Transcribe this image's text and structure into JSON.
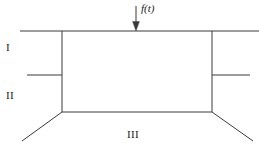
{
  "figure": {
    "type": "structural-frame-diagram",
    "background_color": "#ffffff",
    "line_color": "#3a3a3a",
    "text_color": "#1a1a1a",
    "width": 259,
    "height": 158,
    "labels": {
      "region_1": "I",
      "region_2": "II",
      "region_3": "III",
      "force": "f(t)"
    },
    "load": {
      "label": "f(t)",
      "direction": "down",
      "arrow_x": 136,
      "arrow_top_y": 6,
      "arrow_tip_y": 30
    },
    "geometry": {
      "top_beam": {
        "y": 31,
        "x_start": 20,
        "x_end": 259
      },
      "left_column": {
        "x": 62,
        "y_top": 31,
        "y_bottom": 112
      },
      "right_column": {
        "x": 212,
        "y_top": 31,
        "y_bottom": 112
      },
      "bottom_beam": {
        "y": 112,
        "x_start": 62,
        "x_end": 212
      },
      "mid_left_stub": {
        "y": 75,
        "x_start": 27,
        "x_end": 62
      },
      "mid_right_stub": {
        "y": 75,
        "x_start": 212,
        "x_end": 250
      },
      "left_diagonal": {
        "x1": 62,
        "y1": 112,
        "x2": 22,
        "y2": 141
      },
      "right_diagonal": {
        "x1": 212,
        "y1": 112,
        "x2": 253,
        "y2": 141
      }
    }
  }
}
